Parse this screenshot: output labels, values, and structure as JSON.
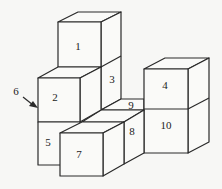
{
  "diagram": {
    "type": "isometric-cube-stack",
    "labels": {
      "c1": "1",
      "c2": "2",
      "c3": "3",
      "c4": "4",
      "c5": "5",
      "c6": "6",
      "c7": "7",
      "c8": "8",
      "c9": "9",
      "c10": "10"
    },
    "colors": {
      "stroke": "#2a2a2a",
      "face": "#fafaf8",
      "background": "#f7f7f5"
    }
  }
}
